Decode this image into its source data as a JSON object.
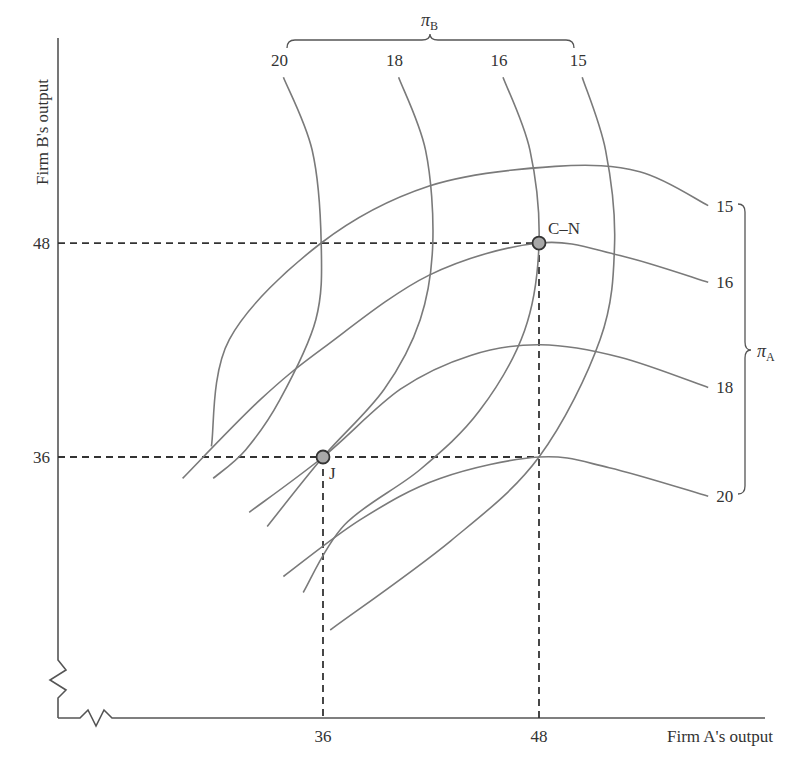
{
  "chart_data": {
    "type": "line",
    "title": "",
    "xlabel": "Firm A's output",
    "ylabel": "Firm B's output",
    "x_ticks": [
      36,
      48
    ],
    "y_ticks": [
      48,
      36
    ],
    "x_tick_labels": [
      "36",
      "48"
    ],
    "y_tick_labels": [
      "48",
      "36"
    ],
    "axis_breaks": true,
    "grid": false,
    "guides": [
      {
        "name": "C-N",
        "x": 48,
        "y": 48
      },
      {
        "name": "J",
        "x": 36,
        "y": 36
      }
    ],
    "points": [
      {
        "label": "C–N",
        "x": 48,
        "y": 48
      },
      {
        "label": "J",
        "x": 36,
        "y": 36
      }
    ],
    "groups": {
      "firm_a": {
        "symbol": "π",
        "subscript": "A",
        "placement": "right"
      },
      "firm_b": {
        "symbol": "π",
        "subscript": "B",
        "placement": "top"
      }
    },
    "series": [
      {
        "name": "pi_A = 15",
        "group": "firm_a",
        "label": "15",
        "points": [
          [
            29.8,
            36.6
          ],
          [
            30.8,
            42.6
          ],
          [
            35.9,
            48.0
          ],
          [
            41.9,
            51.2
          ],
          [
            48.9,
            52.3
          ],
          [
            53.6,
            52.0
          ],
          [
            57.4,
            50.1
          ]
        ]
      },
      {
        "name": "pi_A = 16",
        "group": "firm_a",
        "label": "16",
        "points": [
          [
            28.2,
            34.8
          ],
          [
            32.5,
            39.2
          ],
          [
            36.0,
            42.1
          ],
          [
            41.9,
            46.2
          ],
          [
            48.0,
            48.0
          ],
          [
            52.5,
            47.3
          ],
          [
            57.4,
            45.8
          ]
        ]
      },
      {
        "name": "pi_A = 18",
        "group": "firm_a",
        "label": "18",
        "points": [
          [
            31.9,
            32.9
          ],
          [
            36.0,
            36.0
          ],
          [
            40.3,
            39.8
          ],
          [
            44.2,
            41.7
          ],
          [
            48.1,
            42.3
          ],
          [
            52.5,
            41.6
          ],
          [
            57.4,
            39.9
          ]
        ]
      },
      {
        "name": "pi_A = 20",
        "group": "firm_a",
        "label": "20",
        "points": [
          [
            33.8,
            29.3
          ],
          [
            38.1,
            32.5
          ],
          [
            42.5,
            34.8
          ],
          [
            48.0,
            36.0
          ],
          [
            51.9,
            35.4
          ],
          [
            57.4,
            33.8
          ]
        ]
      },
      {
        "name": "pi_B = 20",
        "group": "firm_b",
        "label": "20",
        "points": [
          [
            33.8,
            57.3
          ],
          [
            35.4,
            53.2
          ],
          [
            35.9,
            48.0
          ],
          [
            35.6,
            43.7
          ],
          [
            33.6,
            39.2
          ],
          [
            31.7,
            36.4
          ],
          [
            29.9,
            34.8
          ]
        ]
      },
      {
        "name": "pi_B = 18",
        "group": "firm_b",
        "label": "18",
        "points": [
          [
            40.2,
            57.3
          ],
          [
            41.7,
            53.2
          ],
          [
            42.1,
            48.0
          ],
          [
            41.4,
            43.7
          ],
          [
            39.4,
            39.8
          ],
          [
            36.0,
            36.0
          ],
          [
            32.9,
            32.1
          ]
        ]
      },
      {
        "name": "pi_B = 16",
        "group": "firm_b",
        "label": "16",
        "points": [
          [
            46.0,
            57.3
          ],
          [
            47.5,
            53.2
          ],
          [
            48.0,
            48.0
          ],
          [
            47.2,
            43.1
          ],
          [
            44.7,
            38.6
          ],
          [
            41.4,
            35.3
          ],
          [
            37.2,
            32.2
          ],
          [
            34.9,
            28.4
          ]
        ]
      },
      {
        "name": "pi_B = 15",
        "group": "firm_b",
        "label": "15",
        "points": [
          [
            50.4,
            57.3
          ],
          [
            51.7,
            53.2
          ],
          [
            52.2,
            48.0
          ],
          [
            51.4,
            42.6
          ],
          [
            48.0,
            36.0
          ],
          [
            43.1,
            31.3
          ],
          [
            36.4,
            26.3
          ]
        ]
      }
    ]
  }
}
